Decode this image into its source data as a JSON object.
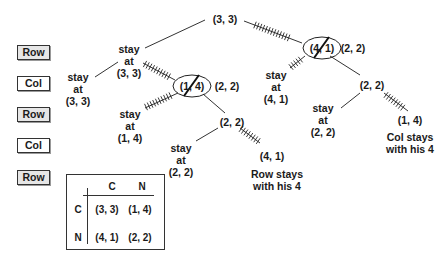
{
  "players": {
    "rows": [
      {
        "label": "Row",
        "shaded": true
      },
      {
        "label": "Col",
        "shaded": false
      },
      {
        "label": "Row",
        "shaded": true
      },
      {
        "label": "Col",
        "shaded": false
      },
      {
        "label": "Row",
        "shaded": true
      }
    ]
  },
  "tree": {
    "root": "(3, 3)",
    "left_node": {
      "line1": "stay",
      "line2": "at",
      "line3": "(3, 3)"
    },
    "left_leaf": {
      "line1": "stay",
      "line2": "at",
      "line3": "(3, 3)"
    },
    "struck_node_left": {
      "value": "(1, 4)",
      "replacement": "(2, 2)"
    },
    "stay_14": {
      "line1": "stay",
      "line2": "at",
      "line3": "(1, 4)"
    },
    "mid_22": "(2, 2)",
    "stay_22_left": {
      "line1": "stay",
      "line2": "at",
      "line3": "(2, 2)"
    },
    "leaf_41": "(4, 1)",
    "row_note": {
      "line1": "Row stays",
      "line2": "with his 4"
    },
    "struck_node_right": {
      "value": "(4, 1)",
      "replacement": "(2, 2)"
    },
    "stay_41": {
      "line1": "stay",
      "line2": "at",
      "line3": "(4, 1)"
    },
    "right_22": "(2, 2)",
    "stay_22_right": {
      "line1": "stay",
      "line2": "at",
      "line3": "(2, 2)"
    },
    "leaf_14": "(1, 4)",
    "col_note": {
      "line1": "Col stays",
      "line2": "with his 4"
    }
  },
  "matrix": {
    "col_headers": [
      "C",
      "N"
    ],
    "row_headers": [
      "C",
      "N"
    ],
    "cells": [
      [
        "(3, 3)",
        "(1, 4)"
      ],
      [
        "(4, 1)",
        "(2, 2)"
      ]
    ]
  }
}
